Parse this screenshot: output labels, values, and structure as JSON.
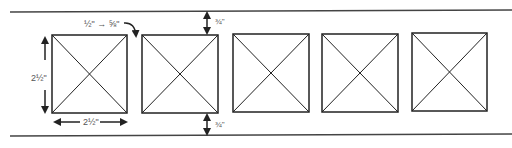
{
  "diagram": {
    "colors": {
      "stroke": "#222222",
      "rule": "#444444",
      "label": "#555555",
      "background": "#ffffff"
    },
    "labels": {
      "tile_height": "2½\"",
      "tile_width": "2½\"",
      "gap": "½\" → ⅝\"",
      "top_margin": "¾\"",
      "bottom_margin": "¾\""
    },
    "tiles": [
      {
        "x": 52,
        "y": 35,
        "w": 75,
        "h": 78
      },
      {
        "x": 142,
        "y": 35,
        "w": 76,
        "h": 78
      },
      {
        "x": 233,
        "y": 34,
        "w": 76,
        "h": 78
      },
      {
        "x": 322,
        "y": 34,
        "w": 76,
        "h": 78
      },
      {
        "x": 412,
        "y": 33,
        "w": 75,
        "h": 78
      }
    ],
    "tile_count": 5
  }
}
